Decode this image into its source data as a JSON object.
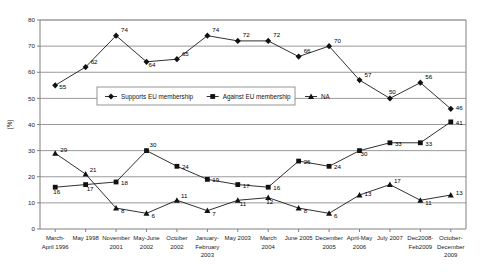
{
  "chart_data": {
    "type": "line",
    "title": "",
    "xlabel": "",
    "ylabel": "(%)",
    "ylim": [
      0,
      80
    ],
    "yticks": [
      0,
      10,
      20,
      30,
      40,
      50,
      60,
      70,
      80
    ],
    "grid": true,
    "legend_position": "upper-center-inside",
    "categories": [
      "March-April 1996",
      "May 1998",
      "November 2001",
      "May-June 2002",
      "October 2002",
      "January-February 2003",
      "May 2003",
      "March 2004",
      "June 2005",
      "December 2005",
      "April-May 2006",
      "July 2007",
      "Dec2008-Feb2009",
      "October-December 2009"
    ],
    "category_lines": [
      [
        "March-",
        "April 1996"
      ],
      [
        "May 1998"
      ],
      [
        "November",
        "2001"
      ],
      [
        "May-June",
        "2002"
      ],
      [
        "October",
        "2002"
      ],
      [
        "January-",
        "February",
        "2003"
      ],
      [
        "May 2003"
      ],
      [
        "March",
        "2004"
      ],
      [
        "June 2005"
      ],
      [
        "December",
        "2005"
      ],
      [
        "April-May",
        "2006"
      ],
      [
        "July 2007"
      ],
      [
        "Dec2008-",
        "Feb2009"
      ],
      [
        "October-",
        "December",
        "2009"
      ]
    ],
    "series": [
      {
        "name": "Supports EU membership",
        "marker": "diamond",
        "values": [
          55,
          62,
          74,
          64,
          65,
          74,
          72,
          72,
          66,
          70,
          57,
          50,
          56,
          46
        ]
      },
      {
        "name": "Against EU membership",
        "marker": "square",
        "values": [
          16,
          17,
          18,
          30,
          24,
          19,
          17,
          16,
          26,
          24,
          30,
          33,
          33,
          41
        ]
      },
      {
        "name": "NA",
        "marker": "triangle",
        "values": [
          29,
          21,
          8,
          6,
          11,
          7,
          11,
          12,
          8,
          6,
          13,
          17,
          11,
          13
        ]
      }
    ],
    "colors": {
      "series_stroke": "#1a1a1a",
      "grid": "#9a9a9a",
      "axis": "#808080",
      "background": "#ffffff"
    }
  },
  "legend": {
    "items": [
      {
        "label": "Supports EU membership",
        "marker": "diamond"
      },
      {
        "label": "Against EU membership",
        "marker": "square"
      },
      {
        "label": "NA",
        "marker": "triangle"
      }
    ]
  }
}
